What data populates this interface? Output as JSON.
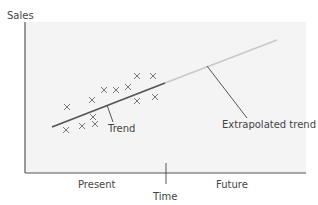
{
  "labels": {
    "y_axis": "Sales",
    "x_axis": "Time",
    "left_region": "Present",
    "right_region": "Future",
    "trend": "Trend",
    "extrapolated": "Extrapolated trend"
  },
  "colors": {
    "plot_bg": "#f4f4f4",
    "axis": "#555555",
    "trend": "#555555",
    "extrapolated": "#c8c8c8",
    "marker": "#777777",
    "text": "#444444"
  },
  "chart_data": {
    "type": "scatter",
    "title": "",
    "xlabel": "Time",
    "ylabel": "Sales",
    "regions": [
      "Present",
      "Future"
    ],
    "points": [
      {
        "x": 66,
        "y": 130
      },
      {
        "x": 82,
        "y": 126
      },
      {
        "x": 95,
        "y": 124
      },
      {
        "x": 67,
        "y": 107
      },
      {
        "x": 92,
        "y": 100
      },
      {
        "x": 93,
        "y": 117
      },
      {
        "x": 104,
        "y": 90
      },
      {
        "x": 116,
        "y": 90
      },
      {
        "x": 128,
        "y": 87
      },
      {
        "x": 137,
        "y": 76
      },
      {
        "x": 153,
        "y": 76
      },
      {
        "x": 137,
        "y": 101
      },
      {
        "x": 155,
        "y": 97
      }
    ],
    "trend_line": {
      "x1": 52,
      "y1": 127,
      "x2": 165,
      "y2": 83
    },
    "extrapolated_line": {
      "x1": 165,
      "y1": 83,
      "x2": 277,
      "y2": 40
    },
    "divider_x": 166,
    "grid": false,
    "legend": "none"
  }
}
